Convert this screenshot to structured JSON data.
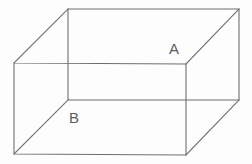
{
  "figure": {
    "kind": "3d-wireframe-cuboid",
    "canvas": {
      "width": 252,
      "height": 164
    },
    "background_color": "#fdfdfd",
    "stroke_color": "#6f6f6f",
    "stroke_width": 1.1,
    "label_color": "#5e5e5e",
    "label_font_size": 15
  },
  "geometry": {
    "vertices": {
      "front_top_left": [
        14,
        63
      ],
      "front_top_right": [
        186,
        64
      ],
      "front_bottom_right": [
        186,
        155
      ],
      "front_bottom_left": [
        14,
        154
      ],
      "back_top_left": [
        68,
        9
      ],
      "back_top_right": [
        239,
        9
      ],
      "back_bottom_right": [
        239,
        100
      ],
      "back_bottom_left": [
        68,
        100
      ]
    },
    "edges": {
      "front_face": "14,63 186,64 186,155 14,154 14,63",
      "back_face": "68,9 239,9 239,100 68,100 68,9",
      "connector_top_left": "14,63 68,9",
      "connector_top_right": "186,64 239,9",
      "connector_bottom_right": "186,155 239,100",
      "connector_bottom_left": "14,154 68,100"
    }
  },
  "labels": {
    "a": {
      "text": "A",
      "name": "vertex-label-a",
      "x": 169,
      "y": 41
    },
    "b": {
      "text": "B",
      "name": "vertex-label-b",
      "x": 69,
      "y": 110
    }
  }
}
